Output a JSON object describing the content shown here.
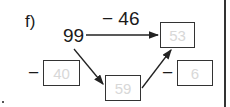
{
  "exercise": {
    "label": "f)",
    "start_value": "99",
    "top_operation": "− 46",
    "left_operation_sign": "−",
    "right_operation_sign": "−",
    "boxes": {
      "result_top": "53",
      "subtrahend_left": "40",
      "intermediate": "59",
      "subtrahend_right": "6"
    }
  },
  "colors": {
    "stroke": "#333333",
    "answer_text": "#d8d8d8"
  }
}
